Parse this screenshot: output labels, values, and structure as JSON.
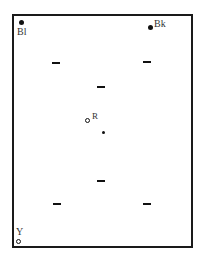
{
  "diagram": {
    "type": "position-map",
    "markers": [
      {
        "id": "Bl",
        "label": "Bl",
        "shape": "filled-circle",
        "x": 21,
        "y": 22
      },
      {
        "id": "Bk",
        "label": "Bk",
        "shape": "filled-circle",
        "x": 150,
        "y": 27
      },
      {
        "id": "R",
        "label": "R",
        "shape": "open-circle",
        "x": 88,
        "y": 121
      },
      {
        "id": "center",
        "label": "",
        "shape": "small-dot",
        "x": 103,
        "y": 132
      },
      {
        "id": "Y",
        "label": "Y",
        "shape": "open-circle",
        "x": 19,
        "y": 242
      }
    ],
    "dashes": [
      {
        "x": 52,
        "y": 63
      },
      {
        "x": 143,
        "y": 62
      },
      {
        "x": 97,
        "y": 87
      },
      {
        "x": 97,
        "y": 181
      },
      {
        "x": 53,
        "y": 204
      },
      {
        "x": 143,
        "y": 204
      }
    ],
    "colors": {
      "ink": "#111111",
      "border": "#1a1a1a",
      "background": "#ffffff"
    }
  }
}
